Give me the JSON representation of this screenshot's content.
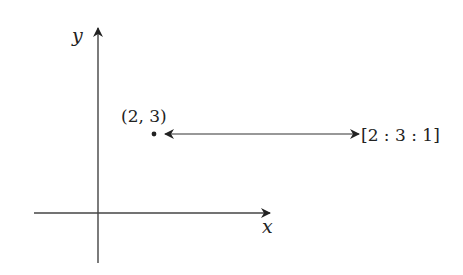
{
  "diagram": {
    "type": "coordinate-projection",
    "axes": {
      "x_label": "x",
      "y_label": "y"
    },
    "point": {
      "label": "(2, 3)",
      "x": 2,
      "y": 3
    },
    "homogeneous": {
      "label": "[2 : 3 : 1]",
      "coords": [
        2,
        3,
        1
      ]
    },
    "connector": "double-headed-arrow",
    "colors": {
      "stroke": "#222222",
      "background": "#ffffff"
    }
  }
}
